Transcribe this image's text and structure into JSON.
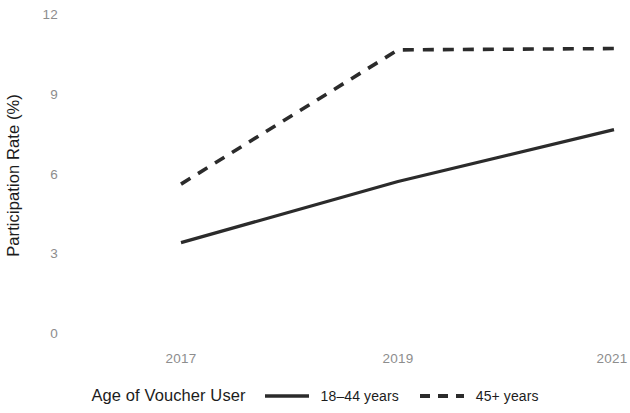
{
  "chart_data": {
    "type": "line",
    "title": "",
    "subtitle": "",
    "xlabel": "",
    "ylabel": "Participation Rate (%)",
    "x": [
      2017,
      2019,
      2021
    ],
    "xtick_labels": [
      "2017",
      "2019",
      "2021"
    ],
    "ytick_labels": [
      "0",
      "3",
      "6",
      "9",
      "12"
    ],
    "ytick_values": [
      0,
      3,
      6,
      9,
      12
    ],
    "xlim": [
      2017,
      2021
    ],
    "ylim": [
      0,
      12
    ],
    "grid": false,
    "legend_position": "bottom",
    "legend_title": "Age of Voucher User",
    "series": [
      {
        "name": "18–44 years",
        "style": "solid",
        "color": "#2b2b2b",
        "values": [
          3.4,
          5.7,
          7.65
        ]
      },
      {
        "name": "45+ years",
        "style": "dashed",
        "color": "#2b2b2b",
        "values": [
          5.6,
          10.65,
          10.7
        ]
      }
    ]
  },
  "axes": {
    "y_title": "Participation Rate (%)",
    "y_ticks": [
      "12",
      "9",
      "6",
      "3",
      "0"
    ],
    "x_ticks": [
      "2017",
      "2019",
      "2021"
    ]
  },
  "legend": {
    "title": "Age of Voucher User",
    "items": [
      {
        "label": "18–44 years",
        "key": "solid-line-key"
      },
      {
        "label": "45+ years",
        "key": "dashed-line-key"
      }
    ]
  },
  "colors": {
    "line": "#2b2b2b",
    "tick_text": "#8d8d8d",
    "title_text": "#1c1c1c",
    "background": "#ffffff"
  }
}
